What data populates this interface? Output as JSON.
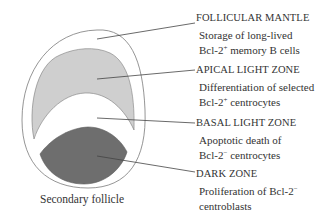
{
  "diagram": {
    "caption": "Secondary follicle",
    "colors": {
      "outline": "#7a7a7a",
      "mantle": "#ffffff",
      "apical_light_zone": "#cfcfcf",
      "basal_light_zone": "#ffffff",
      "dark_zone": "#6e6e6e",
      "leader_line": "#444444"
    },
    "zones": [
      {
        "heading": "FOLLICULAR MANTLE",
        "desc_line1_pre": "Storage of long-lived",
        "desc_line2_pre": "Bcl-2",
        "desc_line2_sup": "+",
        "desc_line2_post": " memory B cells"
      },
      {
        "heading": "APICAL LIGHT ZONE",
        "desc_line1_pre": "Differentiation of selected",
        "desc_line2_pre": "Bcl-2",
        "desc_line2_sup": "+",
        "desc_line2_post": " centrocytes"
      },
      {
        "heading": "BASAL LIGHT ZONE",
        "desc_line1_pre": "Apoptotic death of",
        "desc_line2_pre": "Bcl-2",
        "desc_line2_sup": "−",
        "desc_line2_post": " centrocytes"
      },
      {
        "heading": "DARK ZONE",
        "desc_line1_pre": "Proliferation of Bcl-2",
        "desc_line1_sup": "−",
        "desc_line2_pre": "centroblasts"
      }
    ]
  }
}
